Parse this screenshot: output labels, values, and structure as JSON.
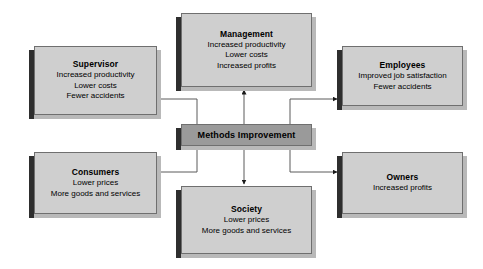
{
  "diagram": {
    "center": {
      "label": "Methods Improvement",
      "fill": "#9a9a9a"
    },
    "node_fill": "#cfcfcf",
    "border_color": "#6f6f6f",
    "shadow_color": "#2e2e2e",
    "nodes": [
      {
        "id": "management",
        "title": "Management",
        "lines": [
          "Increased productivity",
          "Lower costs",
          "Increased profits"
        ]
      },
      {
        "id": "supervisor",
        "title": "Supervisor",
        "lines": [
          "Increased productivity",
          "Lower costs",
          "Fewer accidents"
        ]
      },
      {
        "id": "employees",
        "title": "Employees",
        "lines": [
          "Improved job satisfaction",
          "Fewer accidents"
        ]
      },
      {
        "id": "consumers",
        "title": "Consumers",
        "lines": [
          "Lower prices",
          "More goods and services"
        ]
      },
      {
        "id": "society",
        "title": "Society",
        "lines": [
          "Lower prices",
          "More goods and services"
        ]
      },
      {
        "id": "owners",
        "title": "Owners",
        "lines": [
          "Increased profits"
        ]
      }
    ],
    "connectors": [
      {
        "from": "center",
        "to": "management",
        "style": "straight-up"
      },
      {
        "from": "center",
        "to": "society",
        "style": "straight-down"
      },
      {
        "from": "center",
        "to": "supervisor",
        "style": "elbow-left-up"
      },
      {
        "from": "center",
        "to": "consumers",
        "style": "elbow-left-down"
      },
      {
        "from": "center",
        "to": "employees",
        "style": "elbow-right-up"
      },
      {
        "from": "center",
        "to": "owners",
        "style": "elbow-right-down"
      }
    ]
  }
}
